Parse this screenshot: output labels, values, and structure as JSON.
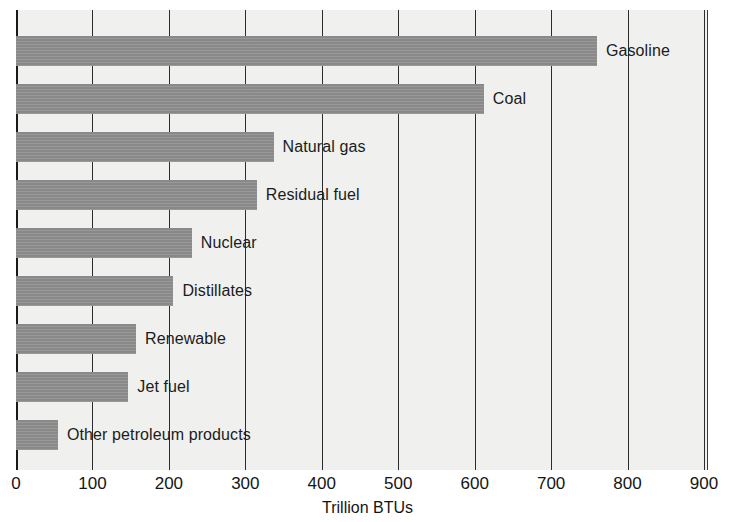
{
  "chart_data": {
    "type": "bar",
    "orientation": "horizontal",
    "title": "",
    "subtitle": "",
    "xlabel": "Trillion BTUs",
    "ylabel": "",
    "xlim": [
      0,
      900
    ],
    "xticks": [
      0,
      100,
      200,
      300,
      400,
      500,
      600,
      700,
      800,
      900
    ],
    "xtick_labels": [
      "0",
      "100",
      "200",
      "300",
      "400",
      "500",
      "600",
      "700",
      "800",
      "900"
    ],
    "grid": "vertical",
    "legend": "none",
    "categories": [
      "Gasoline",
      "Coal",
      "Natural gas",
      "Residual fuel",
      "Nuclear",
      "Distillates",
      "Renewable",
      "Jet fuel",
      "Other petroleum products"
    ],
    "values": [
      760,
      612,
      337,
      315,
      230,
      206,
      157,
      147,
      55
    ],
    "series": [
      {
        "name": "Energy consumption",
        "values": [
          760,
          612,
          337,
          315,
          230,
          206,
          157,
          147,
          55
        ]
      }
    ],
    "bar_color": "#8d8d8d",
    "plot_background": "#f0f0ee",
    "axis_color": "#17191a"
  }
}
